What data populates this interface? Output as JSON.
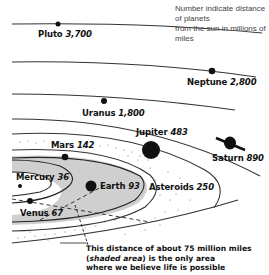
{
  "note": {
    "line1": "Number indicate distance of planets",
    "line2": "from the sun in millions of miles"
  },
  "planets": [
    {
      "name": "Mercury",
      "distance": "36"
    },
    {
      "name": "Venus",
      "distance": "67"
    },
    {
      "name": "Earth",
      "distance": "93"
    },
    {
      "name": "Mars",
      "distance": "142"
    },
    {
      "name": "Asteroids",
      "distance": "250"
    },
    {
      "name": "Jupiter",
      "distance": "483"
    },
    {
      "name": "Saturn",
      "distance": "890"
    },
    {
      "name": "Uranus",
      "distance": "1,800"
    },
    {
      "name": "Neptune",
      "distance": "2,800"
    },
    {
      "name": "Pluto",
      "distance": "3,700"
    }
  ],
  "caption": {
    "line1": "This distance of about 75 million miles",
    "line2_open": "(",
    "line2_italic": "shaded area",
    "line2_rest": ") is the only area",
    "line3": "where we believe life is possible"
  },
  "colors": {
    "line": "#222222",
    "shade": "#cfcfcf",
    "planet": "#111111"
  }
}
